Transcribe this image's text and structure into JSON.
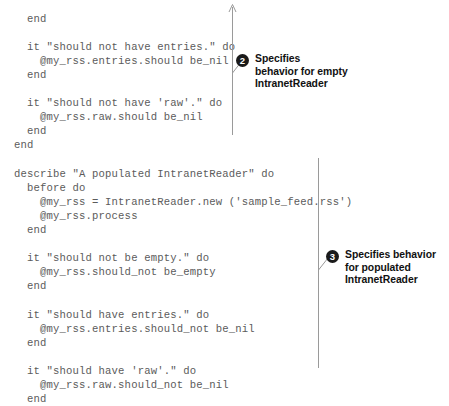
{
  "code": {
    "language": "ruby",
    "lines": [
      "  end",
      "",
      "  it \"should not have entries.\" do",
      "    @my_rss.entries.should be_nil",
      "  end",
      "",
      "  it \"should not have 'raw'.\" do",
      "    @my_rss.raw.should be_nil",
      "  end",
      "end",
      "",
      "describe \"A populated IntranetReader\" do",
      "  before do",
      "    @my_rss = IntranetReader.new ('sample_feed.rss')",
      "    @my_rss.process",
      "  end",
      "",
      "  it \"should not be empty.\" do",
      "    @my_rss.should_not be_empty",
      "  end",
      "",
      "  it \"should have entries.\" do",
      "    @my_rss.entries.should_not be_nil",
      "  end",
      "",
      "  it \"should have 'raw'.\" do",
      "    @my_rss.raw.should_not be_nil",
      "  end"
    ]
  },
  "annotations": [
    {
      "number": "2",
      "text": "Specifies\nbehavior for empty\nIntranetReader"
    },
    {
      "number": "3",
      "text": "Specifies behavior\nfor populated\nIntranetReader"
    }
  ],
  "colors": {
    "code_text": "#5b5b5b",
    "annotation_text": "#111111",
    "marker_fill": "#1a1a1a",
    "marker_number": "#ffffff",
    "rule_line": "#9a9a9a",
    "background": "#ffffff"
  }
}
